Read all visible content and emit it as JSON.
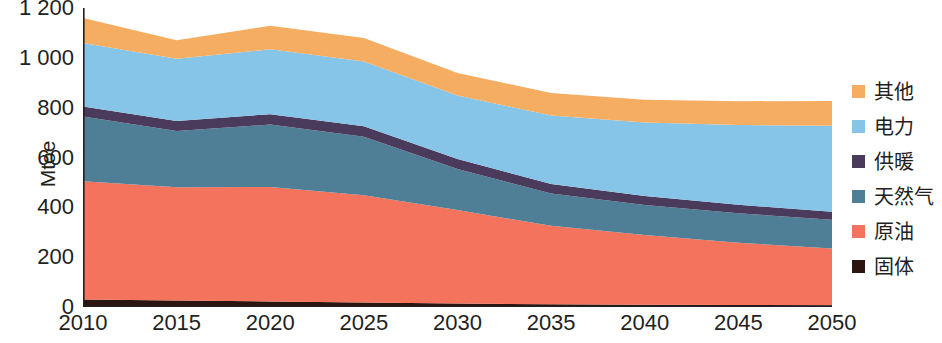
{
  "chart_data": {
    "type": "area",
    "title": "",
    "subtitle": "",
    "xlabel": "",
    "ylabel": "Mtoe",
    "stacked": true,
    "grid": false,
    "legend_position": "right",
    "xlim": [
      2010,
      2050
    ],
    "ylim": [
      0,
      1200
    ],
    "yticks": [
      0,
      200,
      400,
      600,
      800,
      1000,
      1200
    ],
    "ytick_labels": [
      "0",
      "200",
      "400",
      "600",
      "800",
      "1 000",
      "1 200"
    ],
    "categories": [
      2010,
      2015,
      2020,
      2025,
      2030,
      2035,
      2040,
      2045,
      2050
    ],
    "xtick_labels": [
      "2010",
      "2015",
      "2020",
      "2025",
      "2030",
      "2035",
      "2040",
      "2045",
      "2050"
    ],
    "series": [
      {
        "name": "固体",
        "color": "#2b1510",
        "values": [
          30,
          26,
          22,
          18,
          14,
          11,
          9,
          8,
          7
        ]
      },
      {
        "name": "原油",
        "color": "#f4735c",
        "values": [
          475,
          455,
          460,
          430,
          375,
          315,
          280,
          250,
          228
        ]
      },
      {
        "name": "天然气",
        "color": "#4e7f96",
        "values": [
          260,
          225,
          250,
          235,
          165,
          130,
          120,
          118,
          115
        ]
      },
      {
        "name": "供暖",
        "color": "#4a3a5c",
        "values": [
          40,
          40,
          42,
          42,
          40,
          38,
          36,
          34,
          32
        ]
      },
      {
        "name": "电力",
        "color": "#86c5e8",
        "values": [
          255,
          250,
          260,
          260,
          255,
          275,
          295,
          320,
          345
        ]
      },
      {
        "name": "其他",
        "color": "#f5ad62",
        "values": [
          100,
          75,
          95,
          95,
          90,
          90,
          92,
          96,
          100
        ]
      }
    ],
    "totals": [
      1160,
      1071,
      1129,
      1080,
      939,
      859,
      832,
      826,
      827
    ]
  },
  "legend": {
    "items": [
      {
        "label": "其他",
        "color": "#f5ad62"
      },
      {
        "label": "电力",
        "color": "#86c5e8"
      },
      {
        "label": "供暖",
        "color": "#4a3a5c"
      },
      {
        "label": "天然气",
        "color": "#4e7f96"
      },
      {
        "label": "原油",
        "color": "#f4735c"
      },
      {
        "label": "固体",
        "color": "#2b1510"
      }
    ]
  },
  "axis": {
    "y_title": "Mtoe"
  }
}
